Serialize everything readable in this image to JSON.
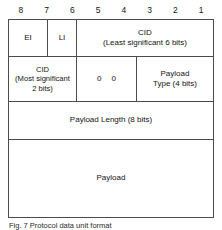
{
  "figure": {
    "bit_ruler": {
      "labels": [
        "8",
        "7",
        "6",
        "5",
        "4",
        "3",
        "2",
        "1"
      ]
    },
    "rows": [
      {
        "name": "row-1",
        "fields": [
          {
            "name": "ei",
            "label": "EI"
          },
          {
            "name": "li",
            "label": "LI"
          },
          {
            "name": "cid_lsb",
            "line1": "CID",
            "line2": "(Least significant 6 bits)"
          }
        ]
      },
      {
        "name": "row-2",
        "fields": [
          {
            "name": "cid_msb",
            "line1": "CID",
            "line2": "(Most significant",
            "line3": "2 bits)"
          },
          {
            "name": "reserved_zeros",
            "bit0": "0",
            "bit1": "0"
          },
          {
            "name": "payload_type",
            "line1": "Payload",
            "line2": "Type (4 bits)"
          }
        ]
      },
      {
        "name": "row-3",
        "fields": [
          {
            "name": "payload_length",
            "label": "Payload Length (8 bits)"
          }
        ]
      },
      {
        "name": "row-4",
        "fields": [
          {
            "name": "payload",
            "label": "Payload"
          }
        ]
      }
    ],
    "caption": "Fig. 7  Protocol data unit format",
    "colors": {
      "line": "#4b4b4b",
      "text": "#141414",
      "background": "#ffffff"
    }
  }
}
